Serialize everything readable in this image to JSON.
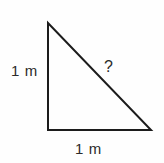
{
  "diagram": {
    "kind": "right-triangle",
    "stroke_color": "#1c1c1c",
    "background_color": "#fefefe",
    "text_color": "#2b2b2b",
    "stroke_width": 2,
    "vertices": {
      "apex": {
        "x": 48,
        "y": 23
      },
      "right_angle": {
        "x": 48,
        "y": 130
      },
      "base_right": {
        "x": 151,
        "y": 130
      }
    },
    "labels": {
      "vertical_leg": "1 m",
      "horizontal_leg": "1 m",
      "hypotenuse": "?"
    }
  }
}
